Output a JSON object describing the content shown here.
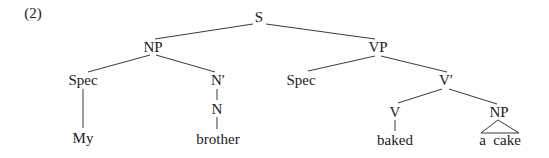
{
  "example_number": "(2)",
  "tree": {
    "S": "S",
    "NP": "NP",
    "VP": "VP",
    "Spec_subject": "Spec",
    "N_bar": "N′",
    "N": "N",
    "Spec_vp": "Spec",
    "V_bar": "V′",
    "V": "V",
    "NP_object": "NP"
  },
  "leaves": {
    "my": "My",
    "brother": "brother",
    "baked": "baked",
    "a_cake": "a  cake"
  },
  "colors": {
    "text": "#1a1a1a",
    "lines": "#3a3a3a",
    "background": "#ffffff"
  }
}
